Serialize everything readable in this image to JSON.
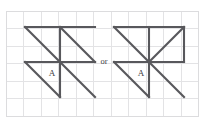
{
  "diagram": {
    "connector_label": "or",
    "background_color": "#ffffff",
    "line_color": "#58585c",
    "grid_color": "#e3e3e5",
    "grid": {
      "origin_x": 6,
      "origin_y": 11,
      "cell": 17.5,
      "cols": 11,
      "rows": 6
    },
    "figures": [
      {
        "name": "left-pinwheel",
        "label": "A",
        "label_x": 52,
        "label_y": 76,
        "origin_x": 25,
        "origin_y": 27,
        "size": 70,
        "segments": [
          {
            "name": "top-edge",
            "x1": 25,
            "y1": 27,
            "x2": 95,
            "y2": 27
          },
          {
            "name": "upper-diagonal-left",
            "x1": 25,
            "y1": 27,
            "x2": 60,
            "y2": 62
          },
          {
            "name": "upper-diagonal-right",
            "x1": 60,
            "y1": 27,
            "x2": 95,
            "y2": 62
          },
          {
            "name": "vertical-upper",
            "x1": 60,
            "y1": 27,
            "x2": 60,
            "y2": 62
          },
          {
            "name": "middle-edge",
            "x1": 25,
            "y1": 62,
            "x2": 95,
            "y2": 62
          },
          {
            "name": "lower-diagonal-left",
            "x1": 25,
            "y1": 62,
            "x2": 60,
            "y2": 97
          },
          {
            "name": "lower-diagonal-right",
            "x1": 60,
            "y1": 62,
            "x2": 95,
            "y2": 97
          },
          {
            "name": "vertical-lower",
            "x1": 60,
            "y1": 62,
            "x2": 60,
            "y2": 97
          }
        ]
      },
      {
        "name": "right-pinwheel",
        "label": "A",
        "label_x": 141,
        "label_y": 76,
        "origin_x": 114,
        "origin_y": 27,
        "size": 70,
        "segments": [
          {
            "name": "top-edge",
            "x1": 114,
            "y1": 27,
            "x2": 184,
            "y2": 27
          },
          {
            "name": "upper-diagonal-left",
            "x1": 114,
            "y1": 27,
            "x2": 149,
            "y2": 62
          },
          {
            "name": "upper-diagonal-right",
            "x1": 184,
            "y1": 27,
            "x2": 149,
            "y2": 62
          },
          {
            "name": "vertical-upper",
            "x1": 149,
            "y1": 27,
            "x2": 149,
            "y2": 62
          },
          {
            "name": "middle-edge-left",
            "x1": 114,
            "y1": 62,
            "x2": 149,
            "y2": 62
          },
          {
            "name": "middle-edge-right",
            "x1": 149,
            "y1": 62,
            "x2": 184,
            "y2": 62
          },
          {
            "name": "right-edge-upper",
            "x1": 184,
            "y1": 27,
            "x2": 184,
            "y2": 62
          },
          {
            "name": "lower-diagonal-left",
            "x1": 114,
            "y1": 62,
            "x2": 149,
            "y2": 97
          },
          {
            "name": "lower-diagonal-right",
            "x1": 149,
            "y1": 62,
            "x2": 184,
            "y2": 97
          },
          {
            "name": "vertical-lower",
            "x1": 149,
            "y1": 62,
            "x2": 149,
            "y2": 97
          }
        ]
      }
    ],
    "connector": {
      "x": 104,
      "y": 64
    }
  }
}
